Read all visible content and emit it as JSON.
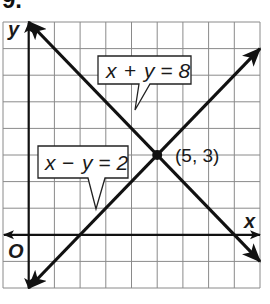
{
  "problem_number": "9.",
  "colors": {
    "grid": "#8a8a8a",
    "ink": "#111111",
    "callout_fill": "#ffffff"
  },
  "chart_data": {
    "type": "line",
    "title": "",
    "xlabel": "x",
    "ylabel": "y",
    "origin_label": "O",
    "xlim": [
      -1,
      9
    ],
    "ylim": [
      -2,
      8
    ],
    "grid": true,
    "grid_step": 1,
    "series": [
      {
        "name": "x + y = 8",
        "equation": "x + y = 8",
        "points": [
          [
            0,
            8
          ],
          [
            9,
            -1
          ]
        ],
        "arrows": "both"
      },
      {
        "name": "x - y = 2",
        "equation": "x − y = 2",
        "points": [
          [
            0,
            -2
          ],
          [
            9,
            7
          ]
        ],
        "arrows": "both"
      }
    ],
    "annotations": [
      {
        "type": "point",
        "x": 5,
        "y": 3,
        "label": "(5, 3)"
      },
      {
        "type": "callout",
        "text": "x + y = 8",
        "target_series": "x + y = 8"
      },
      {
        "type": "callout",
        "text": "x − y = 2",
        "target_series": "x - y = 2"
      }
    ]
  },
  "labels": {
    "x_axis": "x",
    "y_axis": "y",
    "origin": "O",
    "intersection": "(5, 3)",
    "callout1_lhs_x": "x",
    "callout1_op": "+",
    "callout1_rhs": "y = 8",
    "callout2_lhs_x": "x",
    "callout2_op": "−",
    "callout2_rhs": "y = 2"
  }
}
